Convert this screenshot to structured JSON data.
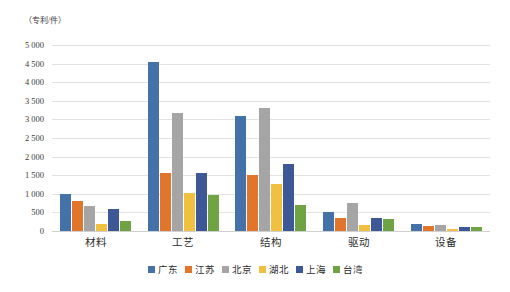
{
  "axis_unit_label": "（专利/件）",
  "chart_data": {
    "type": "bar",
    "title": "",
    "subtitle": "",
    "xlabel": "",
    "ylabel": "（专利/件）",
    "ylim": [
      0,
      5000
    ],
    "ytick_step": 500,
    "ytick_labels": [
      "0",
      "500",
      "1 000",
      "1 500",
      "2 000",
      "2 500",
      "3 000",
      "3 500",
      "4 000",
      "4 500",
      "5 000"
    ],
    "ytick_values": [
      0,
      500,
      1000,
      1500,
      2000,
      2500,
      3000,
      3500,
      4000,
      4500,
      5000
    ],
    "grid": true,
    "grid_axis": "y",
    "legend_position": "bottom",
    "categories": [
      "材料",
      "工艺",
      "结构",
      "驱动",
      "设备"
    ],
    "series": [
      {
        "name": "广东",
        "color": "#4472a8",
        "values": [
          1000,
          4540,
          3080,
          520,
          200
        ]
      },
      {
        "name": "江苏",
        "color": "#e1752b",
        "values": [
          820,
          1550,
          1500,
          340,
          140
        ]
      },
      {
        "name": "北京",
        "color": "#a5a5a5",
        "values": [
          660,
          3160,
          3300,
          760,
          150
        ]
      },
      {
        "name": "湖北",
        "color": "#f0c040",
        "values": [
          200,
          1020,
          1260,
          150,
          60
        ]
      },
      {
        "name": "上海",
        "color": "#3c5896",
        "values": [
          590,
          1550,
          1790,
          350,
          120
        ]
      },
      {
        "name": "台湾",
        "color": "#6fa344",
        "values": [
          270,
          970,
          690,
          330,
          110
        ]
      }
    ]
  }
}
